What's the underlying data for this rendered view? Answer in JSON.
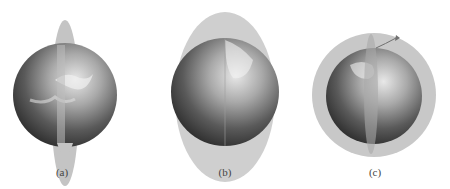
{
  "figure": {
    "panels": [
      {
        "id": "a",
        "label": "(a)",
        "description": "Earth with narrow vertical elliptical orbit plane (polar orbit, edge-on)"
      },
      {
        "id": "b",
        "label": "(b)",
        "description": "Earth with wide vertical elliptical orbit plane"
      },
      {
        "id": "c",
        "label": "(c)",
        "description": "Earth with circular equatorial ring and vertical polar orbit plane with arrow indicating direction"
      }
    ],
    "colors": {
      "orbit_plane": "#bdbdbd",
      "earth_dark": "#3a3a3a",
      "earth_light": "#d8d8d8",
      "background": "#ffffff"
    }
  }
}
